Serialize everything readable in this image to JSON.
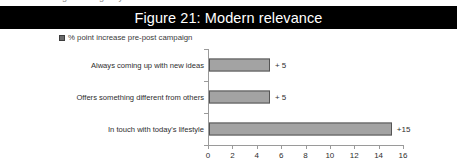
{
  "clipped_top_text": "g  r  g        y",
  "title": {
    "text": "Figure 21: Modern relevance",
    "background_color": "#000000",
    "text_color": "#ffffff"
  },
  "legend": {
    "marker_icon": "filled-square-marker",
    "label": "% point increase pre-post campaign",
    "marker_color": "#6b6b6b",
    "position": "top-left"
  },
  "chart_data": {
    "type": "bar",
    "orientation": "horizontal",
    "title": "Figure 21: Modern relevance",
    "subtitle": "",
    "xlabel": "",
    "ylabel": "",
    "categories": [
      "Always coming up with new ideas",
      "Offers something different from others",
      "In touch with today's lifestyle"
    ],
    "series": [
      {
        "name": "% point increase pre-post campaign",
        "values": [
          5,
          5,
          15
        ]
      }
    ],
    "data_labels": [
      "+ 5",
      "+ 5",
      "+15"
    ],
    "xlim": [
      0,
      16
    ],
    "xticks": [
      0,
      2,
      4,
      6,
      8,
      10,
      12,
      14,
      16
    ],
    "xtick_labels": [
      "0",
      "2",
      "4",
      "6",
      "8",
      "10",
      "12",
      "14",
      "16"
    ],
    "grid": false,
    "legend_position": "top-left",
    "bar_color": "#a3a3a3",
    "bar_border_color": "#555555",
    "axis_color": "#9a9a9a"
  }
}
